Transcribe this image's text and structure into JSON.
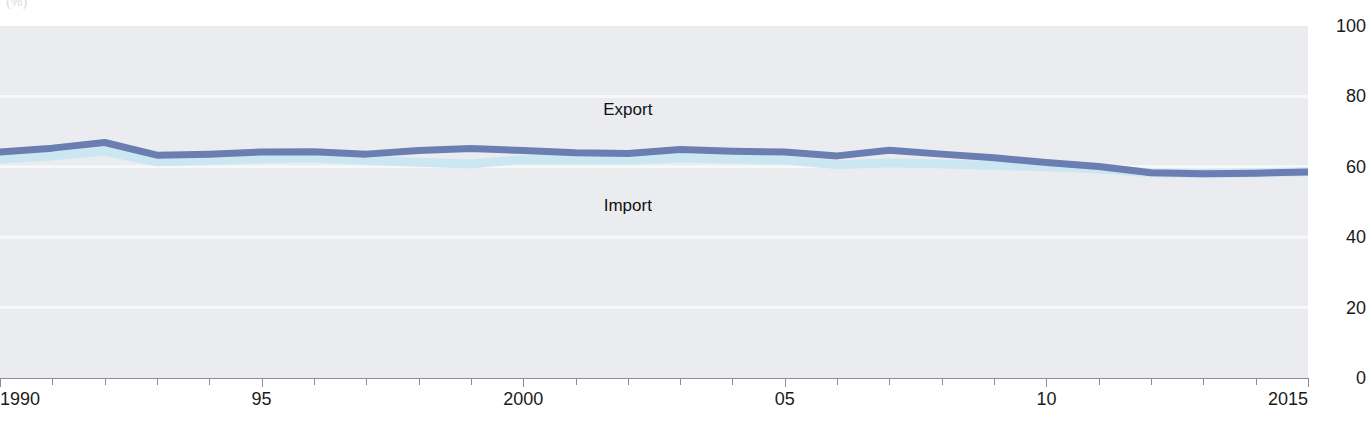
{
  "chart_data": {
    "type": "line",
    "title": "",
    "subtitle": "",
    "unit_label": "(%)",
    "xlabel": "",
    "ylabel": "",
    "xlim": [
      1990,
      2015
    ],
    "ylim": [
      0,
      100
    ],
    "grid": true,
    "gridlines_y": [
      0,
      20,
      40,
      60,
      80,
      100
    ],
    "legend_position": "inline-annotation",
    "x": [
      1990,
      1991,
      1992,
      1993,
      1994,
      1995,
      1996,
      1997,
      1998,
      1999,
      2000,
      2001,
      2002,
      2003,
      2004,
      2005,
      2006,
      2007,
      2008,
      2009,
      2010,
      2011,
      2012,
      2013,
      2014,
      2015
    ],
    "x_tick_labels": [
      "1990",
      "95",
      "2000",
      "05",
      "10",
      "2015"
    ],
    "x_tick_values": [
      1990,
      1995,
      2000,
      2005,
      2010,
      2015
    ],
    "y_tick_labels": [
      "100",
      "80",
      "60",
      "40",
      "20",
      "0"
    ],
    "y_tick_values": [
      100,
      80,
      60,
      40,
      20,
      0
    ],
    "series": [
      {
        "name": "Export",
        "color": "#6b7eb2",
        "values": [
          64.2,
          65.3,
          66.9,
          63.3,
          63.6,
          64.2,
          64.3,
          63.6,
          64.6,
          65.2,
          64.6,
          64.0,
          63.8,
          64.9,
          64.4,
          64.2,
          63.1,
          64.7,
          63.6,
          62.6,
          61.2,
          60.1,
          58.3,
          58.0,
          58.2,
          58.5
        ]
      },
      {
        "name": "Import",
        "color": "#cbe7f2",
        "values": [
          62.2,
          63.1,
          64.4,
          61.4,
          61.8,
          62.3,
          62.5,
          61.8,
          61.3,
          60.8,
          62.1,
          62.0,
          61.9,
          62.5,
          62.2,
          61.9,
          60.6,
          61.1,
          60.8,
          60.4,
          60.0,
          59.4,
          58.3,
          58.1,
          58.3,
          58.6
        ]
      }
    ],
    "annotations": [
      {
        "text": "Export",
        "x": 2002,
        "y": 76
      },
      {
        "text": "Import",
        "x": 2002,
        "y": 49
      }
    ]
  },
  "colors": {
    "plot_background": "#ebecf0",
    "gridline": "#f7f8fa",
    "axis": "#8c8d92",
    "text": "#1b1b1b",
    "export_line": "#6b7eb2",
    "import_line": "#cbe7f2"
  }
}
